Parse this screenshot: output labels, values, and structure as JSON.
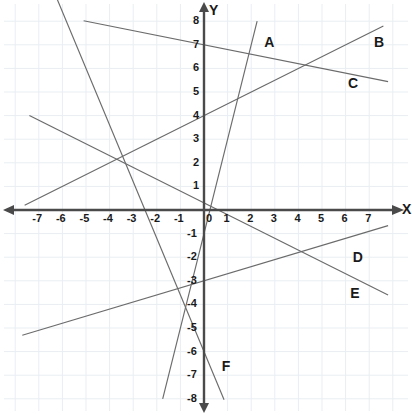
{
  "figure": {
    "type": "coordinate-plane",
    "axis_names": {
      "x": "X",
      "y": "Y"
    },
    "x_ticks": [
      -7,
      -6,
      -5,
      -4,
      -3,
      -2,
      -1,
      0,
      1,
      2,
      3,
      4,
      5,
      6,
      7
    ],
    "y_ticks": [
      8,
      7,
      6,
      5,
      4,
      3,
      2,
      1,
      -1,
      -2,
      -3,
      -4,
      -5,
      -6,
      -7,
      -8
    ],
    "origin_label": "0",
    "grid": true,
    "grid_color": "#e9eef2",
    "axis_color": "#4a4a4a",
    "line_color": "#6b6b6b",
    "background": "#ffffff"
  },
  "chart_data": {
    "type": "line",
    "title": "",
    "xlabel": "X",
    "ylabel": "Y",
    "xlim": [
      -8,
      8
    ],
    "ylim": [
      -8.5,
      8.5
    ],
    "grid": true,
    "legend": "inline-endpoint-labels",
    "series": [
      {
        "name": "A",
        "label": "A",
        "slope": 4.0,
        "intercept": -1.0,
        "equation": "y = 4x - 1",
        "x": [
          -1.75,
          2.25
        ],
        "y": [
          -8.0,
          8.0
        ],
        "label_x": 2.55,
        "label_y": 7.1
      },
      {
        "name": "B",
        "label": "B",
        "slope": 0.5,
        "intercept": 4.0,
        "equation": "y = 0.5x + 4",
        "x": [
          -7.6,
          7.6
        ],
        "y": [
          0.2,
          7.8
        ],
        "label_x": 7.2,
        "label_y": 7.1
      },
      {
        "name": "C",
        "label": "C",
        "slope": -0.2,
        "intercept": 7.0,
        "equation": "y = -0.2x + 7",
        "x": [
          -5.1,
          7.8
        ],
        "y": [
          8.02,
          5.44
        ],
        "label_x": 6.1,
        "label_y": 5.4
      },
      {
        "name": "D",
        "label": "D",
        "slope": 0.3,
        "intercept": -3.0,
        "equation": "y = 0.3x - 3",
        "x": [
          -7.7,
          7.8
        ],
        "y": [
          -5.31,
          -0.66
        ],
        "label_x": 6.3,
        "label_y": -2.0
      },
      {
        "name": "E",
        "label": "E",
        "slope": -0.5,
        "intercept": 0.3,
        "equation": "y = -0.5x + 0.3",
        "x": [
          -7.4,
          7.8
        ],
        "y": [
          4.0,
          -3.6
        ],
        "label_x": 6.2,
        "label_y": -3.5
      },
      {
        "name": "F",
        "label": "F",
        "slope": -2.4,
        "intercept": -6.0,
        "equation": "y = -2.4x - 6",
        "x": [
          -6.5,
          0.85
        ],
        "y": [
          9.6,
          -8.04
        ],
        "label_x": 0.75,
        "label_y": -6.6
      }
    ],
    "notable_intersections": [
      {
        "x": -4,
        "y": 2,
        "lines": [
          "B",
          "E",
          "F"
        ]
      }
    ]
  }
}
